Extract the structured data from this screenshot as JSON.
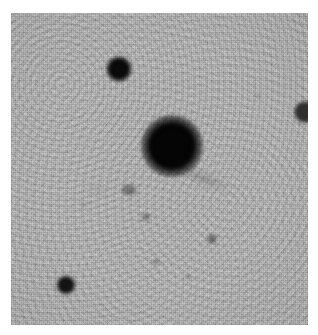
{
  "view": {
    "kind": "astronomical-image-cutout",
    "width": 318,
    "height": 335,
    "page_background": "#ffffff",
    "colormap": "inverted-grayscale",
    "caption": ""
  },
  "field": {
    "x": 11,
    "y": 13,
    "width": 297,
    "height": 312,
    "background_color": "#b5b5b5",
    "noise_light": "#d2d2d2",
    "noise_dark": "#9a9a9a"
  },
  "sources": [
    {
      "id": "central-object",
      "label": "central-saturated-source",
      "cx": 172,
      "cy": 146,
      "core_radius": 17,
      "halo_radius": 31,
      "core_color": "#050505",
      "peak": "saturated"
    },
    {
      "id": "star-upper-left",
      "label": "star-upper-left",
      "cx": 119,
      "cy": 69,
      "core_radius": 7,
      "halo_radius": 13,
      "core_color": "#0a0a0a",
      "peak": "bright"
    },
    {
      "id": "star-lower-left",
      "label": "star-lower-left",
      "cx": 66,
      "cy": 285,
      "core_radius": 5,
      "halo_radius": 10,
      "core_color": "#141414",
      "peak": "moderate"
    },
    {
      "id": "source-right-edge",
      "label": "source-right-edge",
      "cx": 305,
      "cy": 112,
      "core_radius": 6,
      "halo_radius": 11,
      "core_color": "#303030",
      "peak": "faint"
    }
  ],
  "faint_sources": [
    {
      "id": "faint-galaxy-a",
      "label": "faint-extended-source-left",
      "cx": 129,
      "cy": 190,
      "rx": 8,
      "ry": 6,
      "color": "rgba(40,40,40,0.45)"
    },
    {
      "id": "faint-source-b",
      "label": "faint-source-center-lower",
      "cx": 146,
      "cy": 217,
      "rx": 5,
      "ry": 4,
      "color": "rgba(50,50,50,0.42)"
    },
    {
      "id": "faint-source-c",
      "label": "faint-source-lower-right",
      "cx": 212,
      "cy": 239,
      "rx": 5,
      "ry": 5,
      "color": "rgba(35,35,35,0.5)"
    },
    {
      "id": "faint-source-d",
      "label": "faint-source-bottom-center",
      "cx": 156,
      "cy": 262,
      "rx": 4,
      "ry": 3,
      "color": "rgba(60,60,60,0.38)"
    },
    {
      "id": "faint-source-e",
      "label": "faint-source-lower-middle",
      "cx": 188,
      "cy": 277,
      "rx": 3,
      "ry": 3,
      "color": "rgba(70,70,70,0.3)"
    },
    {
      "id": "faint-source-f",
      "label": "faint-source-upper-right",
      "cx": 258,
      "cy": 96,
      "rx": 3,
      "ry": 3,
      "color": "rgba(80,80,80,0.26)"
    },
    {
      "id": "faint-source-g",
      "label": "faint-source-mid-left",
      "cx": 84,
      "cy": 205,
      "rx": 3,
      "ry": 3,
      "color": "rgba(80,80,80,0.24)"
    }
  ],
  "structures": [
    {
      "id": "tail-streak",
      "label": "diffuse-tail-lower-right",
      "x": 186,
      "y": 168,
      "length": 52,
      "thickness": 7,
      "angle_deg": 22,
      "color": "rgba(60,60,60,0.3)"
    },
    {
      "id": "halo-streak-left",
      "label": "diffuse-feature-left",
      "x": 88,
      "y": 186,
      "length": 26,
      "thickness": 5,
      "angle_deg": 8,
      "color": "rgba(90,90,90,0.18)"
    }
  ]
}
